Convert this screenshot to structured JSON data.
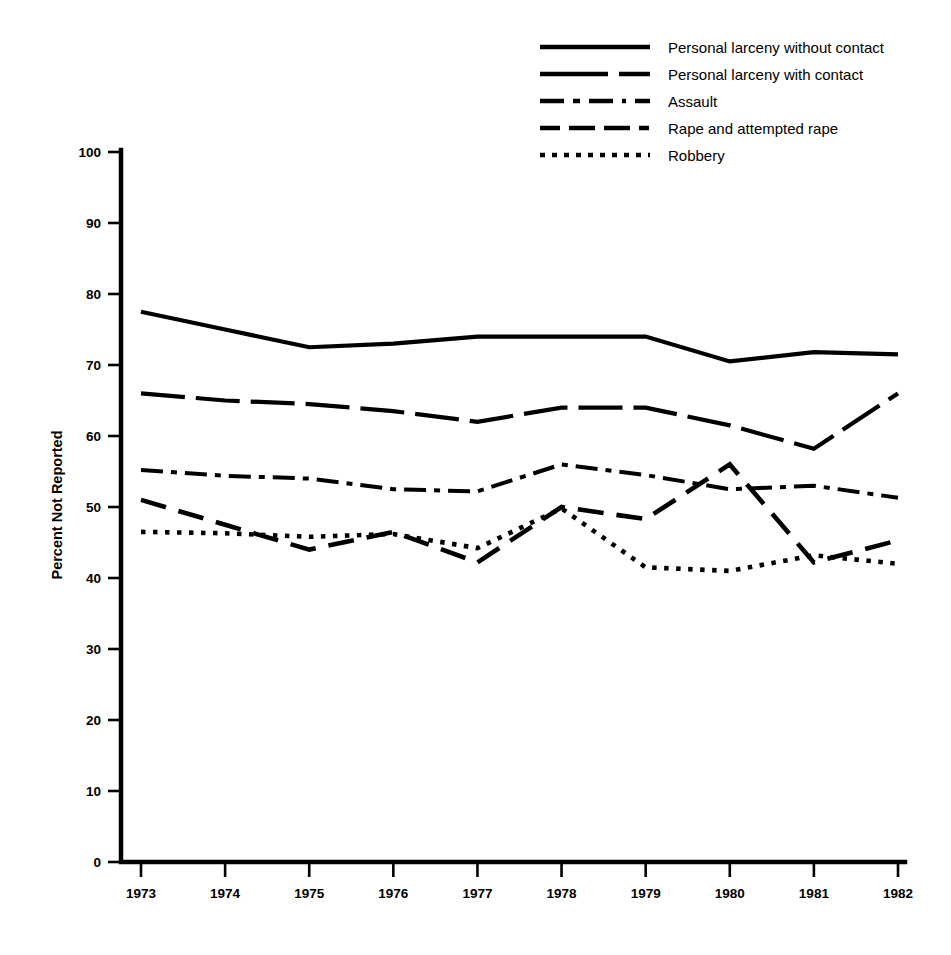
{
  "chart_data": {
    "type": "line",
    "title": "",
    "subtitle": "",
    "xlabel": "",
    "ylabel": "Percent Not Reported",
    "x": [
      1973,
      1974,
      1975,
      1976,
      1977,
      1978,
      1979,
      1980,
      1981,
      1982
    ],
    "categories": [
      "1973",
      "1974",
      "1975",
      "1976",
      "1977",
      "1978",
      "1979",
      "1980",
      "1981",
      "1982"
    ],
    "xlim": [
      1973,
      1982
    ],
    "ylim": [
      0,
      100
    ],
    "yticks": [
      0,
      10,
      20,
      30,
      40,
      50,
      60,
      70,
      80,
      90,
      100
    ],
    "ytick_labels": [
      "0",
      "10",
      "20",
      "30",
      "40",
      "50",
      "60",
      "70",
      "80",
      "90",
      "100"
    ],
    "grid": false,
    "legend_position": "top-right",
    "series": [
      {
        "name": "Personal larceny without contact",
        "dash": "solid",
        "stroke_width": 4.2,
        "dasharray": "none",
        "values": [
          77.5,
          75.0,
          72.5,
          73.0,
          74.0,
          74.0,
          74.0,
          70.5,
          71.8,
          71.5
        ]
      },
      {
        "name": "Personal larceny with contact",
        "dash": "long-dash",
        "stroke_width": 4.2,
        "dasharray": "44 11",
        "values": [
          66.0,
          65.0,
          64.5,
          63.5,
          62.0,
          64.0,
          64.0,
          61.5,
          58.2,
          66.0
        ]
      },
      {
        "name": "Assault",
        "dash": "dash-dot",
        "stroke_width": 4.0,
        "dasharray": "22 8 6 8",
        "values": [
          55.2,
          54.4,
          54.0,
          52.5,
          52.2,
          56.0,
          54.5,
          52.5,
          53.0,
          51.3
        ]
      },
      {
        "name": "Rape and attempted rape",
        "dash": "dash",
        "stroke_width": 4.6,
        "dasharray": "26 13",
        "values": [
          51.0,
          47.5,
          44.0,
          46.5,
          42.2,
          50.0,
          48.3,
          56.0,
          42.2,
          45.3
        ]
      },
      {
        "name": "Robbery",
        "dash": "dot",
        "stroke_width": 4.6,
        "dasharray": "4.5 7.5",
        "values": [
          46.5,
          46.3,
          45.8,
          46.2,
          44.2,
          49.8,
          41.5,
          41.0,
          43.2,
          42.0
        ]
      }
    ],
    "legend": [
      {
        "label": "Personal larceny without contact",
        "dasharray": "none",
        "stroke_width": 4.6
      },
      {
        "label": "Personal larceny with contact",
        "dasharray": "68 11 16 0",
        "stroke_width": 4.6
      },
      {
        "label": "Assault",
        "dasharray": "24 9 7 9 24 9 4 9",
        "stroke_width": 4.6
      },
      {
        "label": "Rape and attempted rape",
        "dasharray": "20 9 26 9 26 9 10 9",
        "stroke_width": 4.6
      },
      {
        "label": "Robbery",
        "dasharray": "5 7",
        "stroke_width": 4.6
      }
    ],
    "colors": {
      "ink": "#000000",
      "background": "#ffffff"
    }
  }
}
